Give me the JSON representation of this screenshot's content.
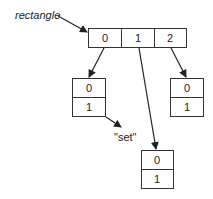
{
  "diagram": {
    "label": "rectangle",
    "annotation": "\"set\"",
    "top_array": {
      "cells": [
        "0",
        "1",
        "2"
      ]
    },
    "sub_arrays": [
      {
        "name": "left",
        "cells": [
          "0",
          "1"
        ],
        "pointed_by": "0"
      },
      {
        "name": "bottom",
        "cells": [
          "0",
          "1"
        ],
        "pointed_by": "1"
      },
      {
        "name": "right",
        "cells": [
          "0",
          "1"
        ],
        "pointed_by": "2"
      }
    ]
  },
  "colors": {
    "stroke": "#333333",
    "text": "#222222",
    "background": "#ffffff"
  }
}
